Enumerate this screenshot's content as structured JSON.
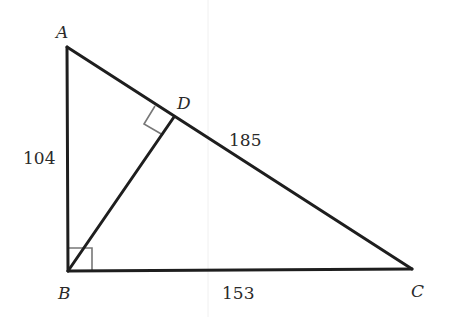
{
  "diagram": {
    "type": "right-triangle-with-altitude",
    "vertices": {
      "A": {
        "label": "A",
        "x": 67,
        "y": 47
      },
      "B": {
        "label": "B",
        "x": 68,
        "y": 271
      },
      "C": {
        "label": "C",
        "x": 412,
        "y": 269
      },
      "D": {
        "label": "D",
        "x": 174,
        "y": 117
      }
    },
    "segments": [
      "AB",
      "BC",
      "AC",
      "BD"
    ],
    "side_labels": {
      "AB": "104",
      "BC": "153",
      "DC": "185"
    },
    "right_angles": [
      "B",
      "D"
    ],
    "colors": {
      "line": "#1e1e1e",
      "right_angle_marker": "#777777",
      "text": "#2a2a2a"
    }
  }
}
